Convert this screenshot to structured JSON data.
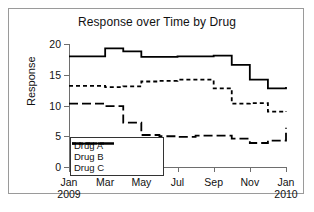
{
  "chart_data": {
    "type": "line",
    "title": "Response over Time by Drug",
    "xlabel": "",
    "ylabel": "Response",
    "ylim": [
      0,
      20
    ],
    "yticks": [
      0,
      5,
      10,
      15,
      20
    ],
    "grid": false,
    "legend_position": "lower-left",
    "step": "post",
    "x": [
      "Jan 2009",
      "Feb 2009",
      "Mar 2009",
      "Apr 2009",
      "May 2009",
      "Jun 2009",
      "Jul 2009",
      "Aug 2009",
      "Sep 2009",
      "Oct 2009",
      "Nov 2009",
      "Dec 2009",
      "Jan 2010"
    ],
    "xtick_labels": [
      {
        "month": "Jan",
        "year": "2009"
      },
      {
        "month": "Mar",
        "year": ""
      },
      {
        "month": "May",
        "year": ""
      },
      {
        "month": "Jul",
        "year": ""
      },
      {
        "month": "Sep",
        "year": ""
      },
      {
        "month": "Nov",
        "year": ""
      },
      {
        "month": "Jan",
        "year": "2010"
      }
    ],
    "series": [
      {
        "name": "Drug A",
        "dash": "solid",
        "values": [
          18.0,
          18.0,
          19.3,
          18.8,
          17.9,
          17.9,
          18.0,
          18.0,
          18.1,
          16.6,
          14.2,
          12.8,
          13.0
        ]
      },
      {
        "name": "Drug B",
        "dash": "fine-dash",
        "values": [
          13.2,
          13.2,
          13.0,
          13.1,
          13.9,
          14.0,
          14.2,
          14.2,
          12.8,
          10.3,
          10.4,
          9.0,
          9.1
        ]
      },
      {
        "name": "Drug C",
        "dash": "long-dash",
        "values": [
          10.3,
          10.3,
          9.9,
          7.2,
          5.2,
          5.0,
          4.9,
          5.1,
          5.1,
          4.6,
          3.9,
          4.3,
          6.4
        ]
      }
    ]
  },
  "legend": {
    "entries": [
      "Drug A",
      "Drug B",
      "Drug C"
    ]
  }
}
